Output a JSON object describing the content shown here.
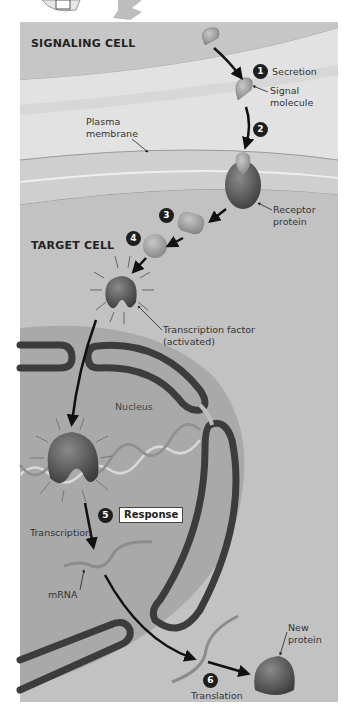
{
  "labels": {
    "signaling_cell": "SIGNALING CELL",
    "target_cell": "TARGET CELL",
    "secretion": "Secretion",
    "signal_molecule_1": "Signal",
    "signal_molecule_2": "molecule",
    "plasma_membrane_1": "Plasma",
    "plasma_membrane_2": "membrane",
    "receptor_protein_1": "Receptor",
    "receptor_protein_2": "protein",
    "transcription_factor_1": "Transcription factor",
    "transcription_factor_2": "(activated)",
    "nucleus": "Nucleus",
    "response": "Response",
    "transcription": "Transcription",
    "mrna": "mRNA",
    "new_protein_1": "New",
    "new_protein_2": "protein",
    "translation": "Translation"
  },
  "steps": [
    "1",
    "2",
    "3",
    "4",
    "5",
    "6"
  ],
  "colors": {
    "panel_bg": "#d6d6d6",
    "signaling_band": "#c4c4c4",
    "membrane_band": "#e8e8e8",
    "target_bg": "#bdbdbd",
    "nucleus_fill": "#a8a8a8",
    "envelope_dark": "#3c3c3c",
    "protein_dark": "#5a5a5a",
    "molecule_light": "#9d9d9d"
  }
}
